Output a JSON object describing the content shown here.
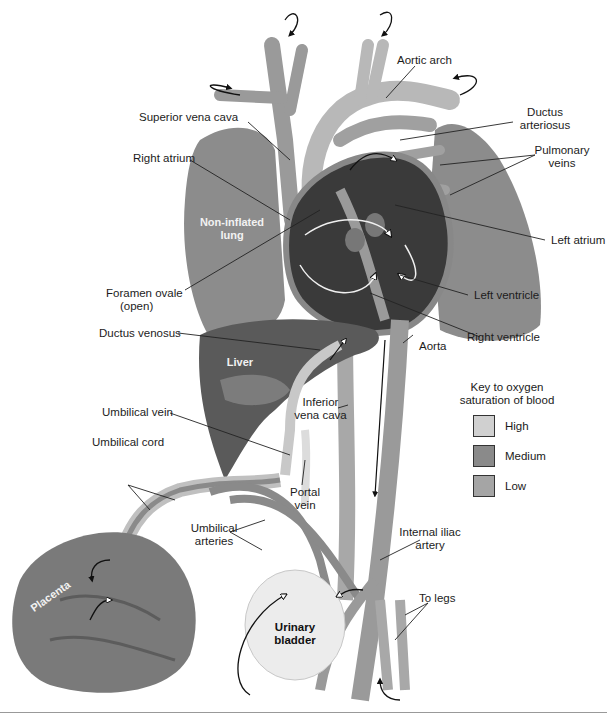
{
  "figure": {
    "colors": {
      "high": "#d0d0d0",
      "medium": "#8a8a8a",
      "low": "#a5a5a5",
      "heart_dark": "#3a3a3a",
      "lung": "#8c8c8c",
      "liver": "#5a5a5a",
      "placenta": "#7a7a7a",
      "bladder": "#ececec"
    }
  },
  "labels": {
    "aortic_arch": "Aortic arch",
    "ductus_arteriosus_1": "Ductus",
    "ductus_arteriosus_2": "arteriosus",
    "superior_vena_cava": "Superior vena cava",
    "pulmonary_veins_1": "Pulmonary",
    "pulmonary_veins_2": "veins",
    "right_atrium": "Right atrium",
    "non_inflated_lung_1": "Non-inflated",
    "non_inflated_lung_2": "lung",
    "left_atrium": "Left atrium",
    "foramen_ovale_1": "Foramen ovale",
    "foramen_ovale_2": "(open)",
    "left_ventricle": "Left ventricle",
    "ductus_venosus": "Ductus venosus",
    "right_ventricle": "Right ventricle",
    "liver": "Liver",
    "aorta": "Aorta",
    "inferior_vena_cava_1": "Inferior",
    "inferior_vena_cava_2": "vena cava",
    "umbilical_vein": "Umbilical vein",
    "umbilical_cord": "Umbilical cord",
    "portal_vein_1": "Portal",
    "portal_vein_2": "vein",
    "umbilical_arteries_1": "Umbilical",
    "umbilical_arteries_2": "arteries",
    "internal_iliac_artery_1": "Internal iliac",
    "internal_iliac_artery_2": "artery",
    "placenta": "Placenta",
    "to_legs": "To legs",
    "urinary_bladder_1": "Urinary",
    "urinary_bladder_2": "bladder"
  },
  "key": {
    "title_1": "Key to oxygen",
    "title_2": "saturation of blood",
    "items": [
      {
        "label": "High",
        "color": "#d0d0d0"
      },
      {
        "label": "Medium",
        "color": "#8a8a8a"
      },
      {
        "label": "Low",
        "color": "#a5a5a5"
      }
    ]
  }
}
